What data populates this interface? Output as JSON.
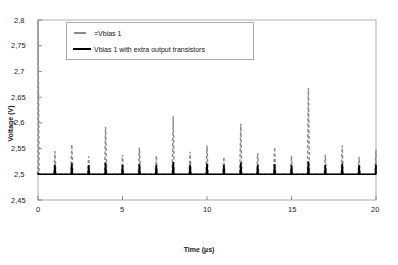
{
  "chart_data": {
    "type": "line",
    "title": "",
    "xlabel": "Time (µs)",
    "ylabel": "Voltage (V)",
    "xlim": [
      0,
      20
    ],
    "ylim": [
      2.45,
      2.8
    ],
    "xticks": [
      0,
      5,
      10,
      15,
      20
    ],
    "xticklabels": [
      "0",
      "5",
      "10",
      "15",
      "20"
    ],
    "yticks": [
      2.45,
      2.5,
      2.55,
      2.6,
      2.65,
      2.7,
      2.75,
      2.8
    ],
    "yticklabels": [
      "2,45",
      "2,5",
      "2,55",
      "2,6",
      "2,65",
      "2,7",
      "2,75",
      "2,8"
    ],
    "grid": false,
    "legend_position": "upper-left-inside",
    "baseline": 2.5,
    "spike_times": [
      0,
      1,
      2,
      3,
      4,
      5,
      6,
      7,
      8,
      9,
      10,
      11,
      12,
      13,
      14,
      15,
      16,
      17,
      18,
      19,
      20
    ],
    "series": [
      {
        "name": "Vbias 1",
        "style": "dashed",
        "color": "#8a8a8a",
        "legend_label": "=Vbias 1",
        "baseline": 2.5,
        "peak_values": [
          2.8,
          2.545,
          2.558,
          2.535,
          2.592,
          2.538,
          2.552,
          2.536,
          2.613,
          2.544,
          2.556,
          2.534,
          2.598,
          2.541,
          2.553,
          2.536,
          2.668,
          2.538,
          2.556,
          2.534,
          2.548
        ]
      },
      {
        "name": "Vbias 1 with extra output transistors",
        "style": "solid",
        "color": "#000000",
        "legend_label": "Vbias 1 with extra output transistors",
        "baseline": 2.5,
        "peak_values": [
          2.503,
          2.519,
          2.521,
          2.518,
          2.523,
          2.518,
          2.52,
          2.518,
          2.524,
          2.519,
          2.521,
          2.518,
          2.523,
          2.518,
          2.52,
          2.518,
          2.525,
          2.518,
          2.521,
          2.518,
          2.519
        ]
      }
    ]
  },
  "axis": {
    "y_tick_labels": [
      "2,8",
      "2,75",
      "2,7",
      "2,65",
      "2,6",
      "2,55",
      "2,5",
      "2,45"
    ],
    "x_tick_labels": [
      "0",
      "5",
      "10",
      "15",
      "20"
    ],
    "y_title": "Voltage (V)",
    "x_title": "Time (µs)"
  },
  "legend": {
    "entries": [
      {
        "label": "=Vbias 1",
        "style": "dashed"
      },
      {
        "label": "Vbias 1 with extra output transistors",
        "style": "solid"
      }
    ]
  }
}
